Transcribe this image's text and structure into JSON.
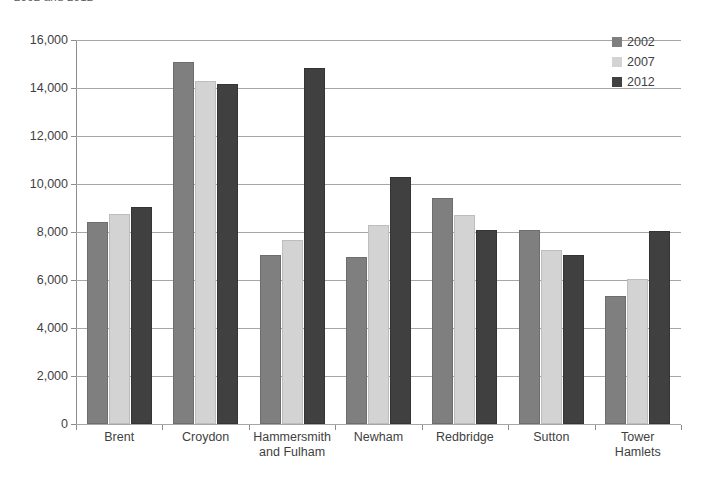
{
  "chart_data": {
    "type": "bar",
    "title": "2002 and 2012",
    "categories": [
      "Brent",
      "Croydon",
      "Hammersmith and Fulham",
      "Newham",
      "Redbridge",
      "Sutton",
      "Tower Hamlets"
    ],
    "category_lines": [
      [
        "Brent"
      ],
      [
        "Croydon"
      ],
      [
        "Hammersmith",
        "and Fulham"
      ],
      [
        "Newham"
      ],
      [
        "Redbridge"
      ],
      [
        "Sutton"
      ],
      [
        "Tower",
        "Hamlets"
      ]
    ],
    "series": [
      {
        "name": "2002",
        "color": "#7f7f7f",
        "values": [
          8400,
          15100,
          7050,
          6950,
          9400,
          8100,
          5350
        ]
      },
      {
        "name": "2007",
        "color": "#d3d3d3",
        "values": [
          8750,
          14300,
          7650,
          8300,
          8700,
          7250,
          6050
        ]
      },
      {
        "name": "2012",
        "color": "#404040",
        "values": [
          9050,
          14150,
          14850,
          10300,
          8100,
          7050,
          8050
        ]
      }
    ],
    "xlabel": "",
    "ylabel": "",
    "ylim": [
      0,
      16000
    ],
    "ytick_step": 2000,
    "ytick_labels": [
      "16,000",
      "14,000",
      "12,000",
      "10,000",
      "8,000",
      "6,000",
      "4,000",
      "2,000",
      "0"
    ],
    "ytick_values": [
      16000,
      14000,
      12000,
      10000,
      8000,
      6000,
      4000,
      2000,
      0
    ],
    "grid": true,
    "grid_axis": "y",
    "legend_position": "top-right",
    "legend_entries": [
      "2002",
      "2007",
      "2012"
    ]
  }
}
